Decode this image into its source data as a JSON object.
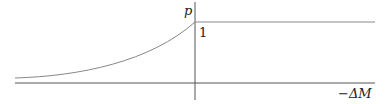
{
  "diagram": {
    "y_axis_label": "p",
    "level_label": "1",
    "x_axis_label": "−ΔM",
    "curve": {
      "left_start": [
        15,
        78
      ],
      "peak": [
        195,
        22
      ],
      "plateau_end": [
        375,
        22
      ]
    },
    "colors": {
      "axis": "#555555",
      "curve": "#888888"
    }
  }
}
